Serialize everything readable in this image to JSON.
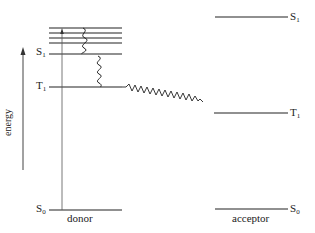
{
  "diagram": {
    "type": "jablonski-energy-transfer",
    "axis": {
      "label": "energy",
      "direction": "up"
    },
    "donor": {
      "label": "donor",
      "levels": [
        {
          "name": "S",
          "sub": "1",
          "y": 54
        },
        {
          "name": "T",
          "sub": "1",
          "y": 87
        },
        {
          "name": "S",
          "sub": "0",
          "y": 210
        }
      ],
      "vibrational_levels_y": [
        28,
        33,
        38,
        43
      ]
    },
    "acceptor": {
      "label": "acceptor",
      "levels": [
        {
          "name": "S",
          "sub": "1",
          "y": 17
        },
        {
          "name": "T",
          "sub": "1",
          "y": 113
        },
        {
          "name": "S",
          "sub": "0",
          "y": 209
        }
      ]
    },
    "transitions": [
      {
        "type": "absorption",
        "from": "donor S0",
        "to": "donor upper vibrational level"
      },
      {
        "type": "vibrational relaxation",
        "from": "donor upper vibrational levels",
        "to": "donor S1"
      },
      {
        "type": "intersystem crossing",
        "from": "donor S1",
        "to": "donor T1"
      },
      {
        "type": "triplet energy transfer",
        "from": "donor T1",
        "to": "acceptor T1"
      }
    ]
  },
  "labels": {
    "donor_s1": {
      "main": "S",
      "sub": "1"
    },
    "donor_t1": {
      "main": "T",
      "sub": "1"
    },
    "donor_s0": {
      "main": "S",
      "sub": "0"
    },
    "acceptor_s1": {
      "main": "S",
      "sub": "1"
    },
    "acceptor_t1": {
      "main": "T",
      "sub": "1"
    },
    "acceptor_s0": {
      "main": "S",
      "sub": "0"
    },
    "donor": "donor",
    "acceptor": "acceptor",
    "energy": "energy"
  }
}
